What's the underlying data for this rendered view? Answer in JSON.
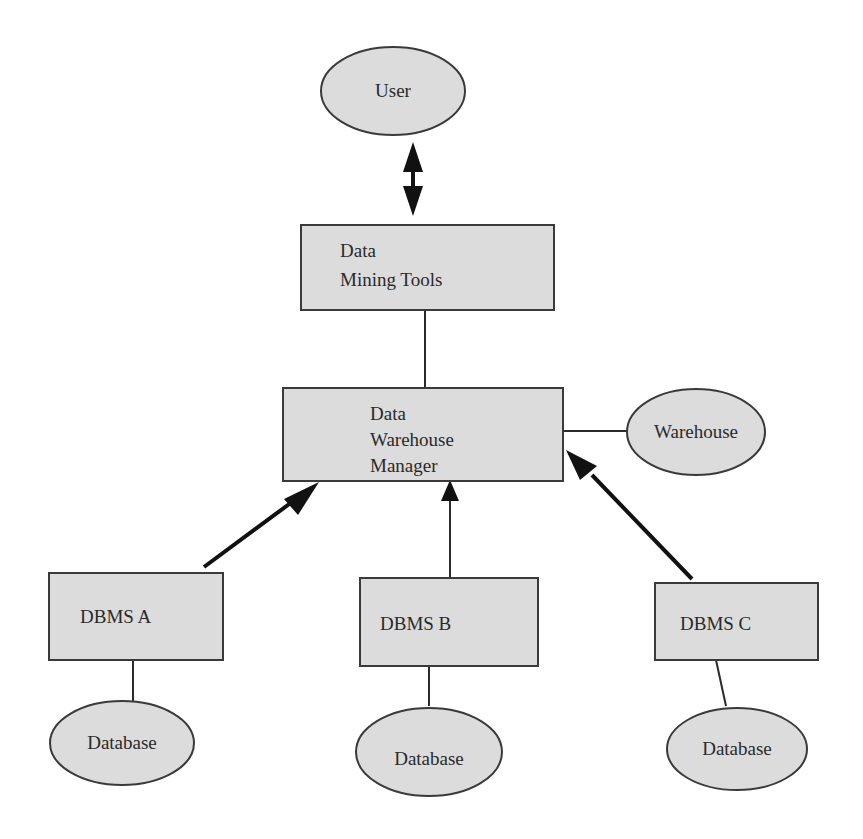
{
  "diagram": {
    "nodes": {
      "user": {
        "label": "User",
        "shape": "ellipse"
      },
      "data_mining_tools": {
        "lines": [
          "Data",
          "Mining Tools"
        ],
        "shape": "rectangle"
      },
      "data_warehouse_manager": {
        "lines": [
          "Data",
          "Warehouse",
          "Manager"
        ],
        "shape": "rectangle"
      },
      "warehouse": {
        "label": "Warehouse",
        "shape": "ellipse"
      },
      "dbms_a": {
        "label": "DBMS A",
        "shape": "rectangle"
      },
      "dbms_b": {
        "label": "DBMS B",
        "shape": "rectangle"
      },
      "dbms_c": {
        "label": "DBMS C",
        "shape": "rectangle"
      },
      "database_a": {
        "label": "Database",
        "shape": "ellipse"
      },
      "database_b": {
        "label": "Database",
        "shape": "ellipse"
      },
      "database_c": {
        "label": "Database",
        "shape": "ellipse"
      }
    },
    "edges": [
      {
        "from": "user",
        "to": "data_mining_tools",
        "type": "bidirectional-arrow"
      },
      {
        "from": "data_mining_tools",
        "to": "data_warehouse_manager",
        "type": "line"
      },
      {
        "from": "data_warehouse_manager",
        "to": "warehouse",
        "type": "line"
      },
      {
        "from": "dbms_a",
        "to": "data_warehouse_manager",
        "type": "arrow"
      },
      {
        "from": "dbms_b",
        "to": "data_warehouse_manager",
        "type": "arrow"
      },
      {
        "from": "dbms_c",
        "to": "data_warehouse_manager",
        "type": "arrow"
      },
      {
        "from": "dbms_a",
        "to": "database_a",
        "type": "line"
      },
      {
        "from": "dbms_b",
        "to": "database_b",
        "type": "line"
      },
      {
        "from": "dbms_c",
        "to": "database_c",
        "type": "line"
      }
    ],
    "colors": {
      "node_fill": "#dcdcdc",
      "node_stroke": "#3a3a3a",
      "edge": "#111111",
      "background": "#ffffff"
    }
  }
}
